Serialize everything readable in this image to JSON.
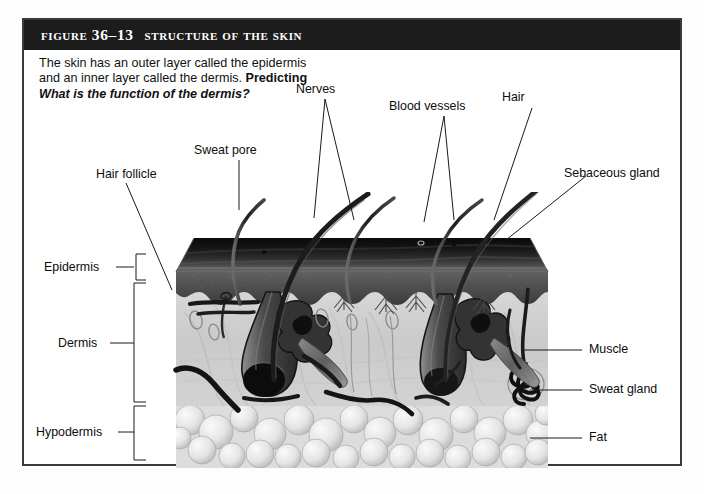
{
  "figure": {
    "number": "Figure 36–13",
    "title": "Structure of the Skin",
    "caption_text": "The skin has an outer layer called the epidermis and an inner layer called the ",
    "caption_text2": "dermis. ",
    "caption_label": "Predicting",
    "caption_question": "What is the function of the dermis?"
  },
  "colors": {
    "title_bar_bg": "#1c1c1c",
    "title_text": "#ffffff",
    "frame_border": "#3a3a3a",
    "page_bg": "#ffffff",
    "label_text": "#0d0d0d",
    "leader_line": "#1a1a1a",
    "epidermis_surface": "#141414",
    "epidermis_band": "#4a4a4a",
    "dermis": "#cfcfcf",
    "hypodermis_fat": "#e3e3e3",
    "hair_shaft": "#2b2b2b"
  },
  "labels": {
    "left": [
      {
        "name": "epidermis",
        "text": "Epidermis"
      },
      {
        "name": "dermis",
        "text": "Dermis"
      },
      {
        "name": "hypodermis",
        "text": "Hypodermis"
      }
    ],
    "top": [
      {
        "name": "hair-follicle",
        "text": "Hair follicle"
      },
      {
        "name": "sweat-pore",
        "text": "Sweat pore"
      },
      {
        "name": "nerves",
        "text": "Nerves"
      },
      {
        "name": "blood-vessels",
        "text": "Blood vessels"
      },
      {
        "name": "hair",
        "text": "Hair"
      }
    ],
    "right": [
      {
        "name": "sebaceous-gland",
        "text": "Sebaceous gland"
      },
      {
        "name": "muscle",
        "text": "Muscle"
      },
      {
        "name": "sweat-gland",
        "text": "Sweat gland"
      },
      {
        "name": "fat",
        "text": "Fat"
      }
    ]
  },
  "diagram": {
    "type": "anatomical-cross-section",
    "layers": [
      {
        "name": "Epidermis",
        "bracket_top": 252,
        "bracket_bottom": 278
      },
      {
        "name": "Dermis",
        "bracket_top": 281,
        "bracket_bottom": 400
      },
      {
        "name": "Hypodermis",
        "bracket_top": 404,
        "bracket_bottom": 458
      }
    ],
    "structures": [
      "hair shafts",
      "hair follicles",
      "sweat pore",
      "sweat gland duct",
      "sebaceous glands",
      "arrector pili muscle",
      "nerve endings",
      "blood vessels",
      "adipose (fat) cells"
    ],
    "hair_count": 5
  }
}
